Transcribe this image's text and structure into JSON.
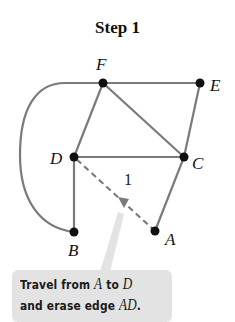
{
  "title": "Step 1",
  "colors": {
    "edge": "#7a7a7a",
    "node": "#111111",
    "callout_bg": "#e3e3e3",
    "pointer": "#e3e3e3"
  },
  "graph": {
    "nodes": [
      {
        "id": "F",
        "label": "F",
        "x": 103,
        "y": 83
      },
      {
        "id": "E",
        "label": "E",
        "x": 200,
        "y": 83
      },
      {
        "id": "D",
        "label": "D",
        "x": 74,
        "y": 157
      },
      {
        "id": "C",
        "label": "C",
        "x": 184,
        "y": 157
      },
      {
        "id": "B",
        "label": "B",
        "x": 74,
        "y": 232
      },
      {
        "id": "A",
        "label": "A",
        "x": 155,
        "y": 231
      }
    ],
    "edges": [
      {
        "from": "F",
        "to": "E",
        "style": "solid"
      },
      {
        "from": "F",
        "to": "D",
        "style": "solid"
      },
      {
        "from": "F",
        "to": "C",
        "style": "solid"
      },
      {
        "from": "E",
        "to": "C",
        "style": "solid"
      },
      {
        "from": "D",
        "to": "C",
        "style": "solid"
      },
      {
        "from": "D",
        "to": "B",
        "style": "solid"
      },
      {
        "from": "C",
        "to": "A",
        "style": "solid"
      },
      {
        "from": "F",
        "to": "B",
        "style": "curved-arc"
      },
      {
        "from": "A",
        "to": "D",
        "style": "dashed",
        "label": "1",
        "direction": "A-to-D"
      }
    ]
  },
  "edge_label_AD": "1",
  "callout": {
    "line1_prefix": "Travel from ",
    "line1_var1": "A",
    "line1_mid": " to ",
    "line1_var2": "D",
    "line2_prefix": "and erase edge ",
    "line2_var": "AD",
    "line2_suffix": "."
  }
}
